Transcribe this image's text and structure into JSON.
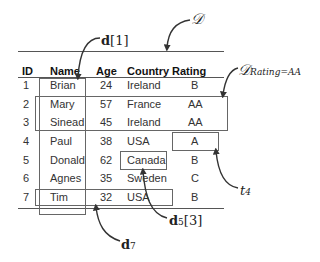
{
  "table": {
    "headers": [
      "ID",
      "Name",
      "Age",
      "Country",
      "Rating"
    ],
    "rows": [
      [
        "1",
        "Brian",
        "24",
        "Ireland",
        "B"
      ],
      [
        "2",
        "Mary",
        "57",
        "France",
        "AA"
      ],
      [
        "3",
        "Sinead",
        "45",
        "Ireland",
        "AA"
      ],
      [
        "4",
        "Paul",
        "38",
        "USA",
        "A"
      ],
      [
        "5",
        "Donald",
        "62",
        "Canada",
        "B"
      ],
      [
        "6",
        "Agnes",
        "35",
        "Sweden",
        "C"
      ],
      [
        "7",
        "Tim",
        "32",
        "USA",
        "B"
      ]
    ]
  },
  "annotations": {
    "dataset": {
      "symbol": "D",
      "label": "𝒟"
    },
    "column": {
      "base": "d",
      "index": "[1]"
    },
    "subset": {
      "base": "𝒟",
      "subscript": "Rating=AA"
    },
    "tuple": {
      "base": "t",
      "subscript": "4"
    },
    "cell": {
      "base": "d",
      "subscript": "5",
      "index": "[3]"
    },
    "row": {
      "base": "d",
      "subscript": "7"
    }
  }
}
